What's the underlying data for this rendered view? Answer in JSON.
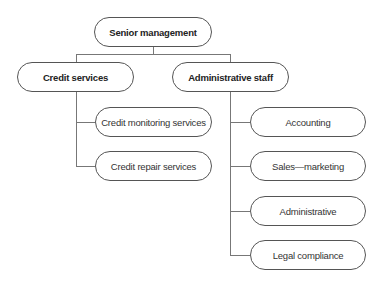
{
  "org_chart": {
    "root": {
      "label": "Senior management"
    },
    "level1": [
      {
        "label": "Credit services"
      },
      {
        "label": "Administrative staff"
      }
    ],
    "credit_services_children": [
      {
        "label": "Credit monitoring services"
      },
      {
        "label": "Credit repair services"
      }
    ],
    "administrative_staff_children": [
      {
        "label": "Accounting"
      },
      {
        "label": "Sales—marketing"
      },
      {
        "label": "Administrative"
      },
      {
        "label": "Legal compliance"
      }
    ]
  }
}
